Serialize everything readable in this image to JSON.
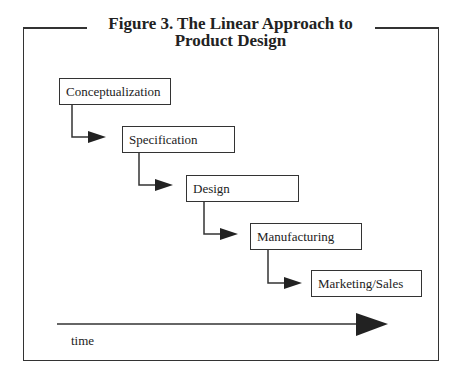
{
  "figure": {
    "title_line1": "Figure 3.  The Linear Approach to",
    "title_line2": "Product Design"
  },
  "steps": [
    {
      "label": "Conceptualization"
    },
    {
      "label": "Specification"
    },
    {
      "label": "Design"
    },
    {
      "label": "Manufacturing"
    },
    {
      "label": "Marketing/Sales"
    }
  ],
  "axis": {
    "label": "time"
  },
  "colors": {
    "line": "#333333",
    "background": "#ffffff"
  }
}
